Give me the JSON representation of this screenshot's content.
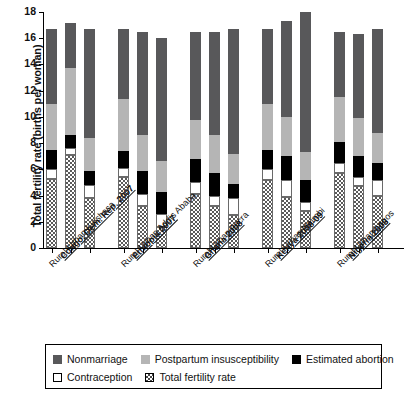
{
  "chart": {
    "ylabel": "Total fertility rate (births per woman)",
    "yticks": [
      "0",
      "2",
      "4",
      "6",
      "8",
      "10",
      "12",
      "14",
      "16",
      "18"
    ]
  },
  "legend": {
    "items": [
      {
        "key": "nonmarriage",
        "label": "Nonmarriage",
        "color": "#58585a"
      },
      {
        "key": "postpartum",
        "label": "Postpartum insusceptibility",
        "color": "#b5b5b5"
      },
      {
        "key": "abortion",
        "label": "Estimated abortion",
        "color": "#000000"
      },
      {
        "key": "contraception",
        "label": "Contraception",
        "color": "#ffffff"
      },
      {
        "key": "tfr",
        "label": "Total fertility rate",
        "color": "#ffffff"
      }
    ]
  },
  "groups": [
    {
      "country": "Congo, Dem. Rep. 2007",
      "bars": "Rural-Urban Kinshasa"
    },
    {
      "country": "Ethiopia 2007",
      "bars": "Rural-Urban Addis Ababa"
    },
    {
      "country": "Ghana 2008",
      "bars": "Rural-Urban Accra"
    },
    {
      "country": "Kenya 2008-09",
      "bars": "Rural-Urban Nairobi"
    },
    {
      "country": "Nigeria 2008",
      "bars": "Rural-Urban Lagos"
    }
  ],
  "chart_data": {
    "type": "bar",
    "title": "",
    "xlabel": "",
    "ylabel": "Total fertility rate (births per woman)",
    "ylim": [
      0,
      18
    ],
    "ytick_step": 2,
    "grid": false,
    "stacked": true,
    "legend_position": "bottom",
    "categories": [
      "Congo, Dem. Rep. 2007 - Rural",
      "Congo, Dem. Rep. 2007 - Urban",
      "Congo, Dem. Rep. 2007 - Kinshasa",
      "Ethiopia 2007 - Rural",
      "Ethiopia 2007 - Urban",
      "Ethiopia 2007 - Addis Ababa",
      "Ghana 2008 - Rural",
      "Ghana 2008 - Urban",
      "Ghana 2008 - Accra",
      "Kenya 2008-09 - Rural",
      "Kenya 2008-09 - Urban",
      "Kenya 2008-09 - Nairobi",
      "Nigeria 2008 - Rural",
      "Nigeria 2008 - Urban",
      "Nigeria 2008 - Lagos"
    ],
    "series": [
      {
        "name": "Total fertility rate",
        "values": [
          5.3,
          7.1,
          3.8,
          5.4,
          3.2,
          1.6,
          4.1,
          3.2,
          2.5,
          5.2,
          3.9,
          2.8,
          5.7,
          4.7,
          4.0
        ]
      },
      {
        "name": "Contraception",
        "values": [
          0.7,
          0.5,
          1.0,
          0.7,
          0.9,
          1.0,
          0.9,
          0.8,
          1.3,
          0.8,
          1.3,
          0.7,
          0.8,
          0.7,
          1.2
        ]
      },
      {
        "name": "Estimated abortion",
        "values": [
          1.5,
          1.0,
          1.1,
          1.3,
          1.8,
          1.7,
          1.8,
          1.7,
          1.1,
          1.5,
          1.8,
          1.7,
          1.6,
          1.6,
          1.3
        ]
      },
      {
        "name": "Postpartum insusceptibility",
        "values": [
          3.5,
          5.1,
          2.5,
          4.0,
          2.7,
          2.3,
          3.0,
          2.9,
          2.3,
          3.5,
          3.0,
          2.1,
          3.4,
          2.9,
          2.3
        ]
      },
      {
        "name": "Nonmarriage",
        "values": [
          5.7,
          3.5,
          8.3,
          5.3,
          7.9,
          9.4,
          6.7,
          7.9,
          9.5,
          5.7,
          7.3,
          10.7,
          5.0,
          6.4,
          7.9
        ]
      }
    ],
    "totals": [
      16.7,
      17.2,
      16.7,
      16.7,
      16.5,
      16.0,
      16.5,
      16.5,
      16.7,
      16.7,
      17.3,
      18.0,
      16.5,
      16.3,
      16.7
    ]
  }
}
